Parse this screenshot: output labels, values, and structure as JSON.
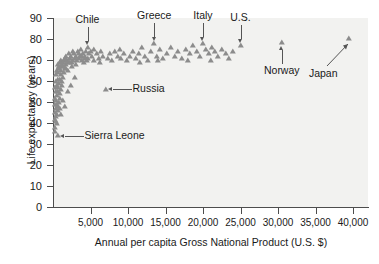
{
  "chart_data": {
    "type": "scatter",
    "title": "",
    "xlabel": "Annual per capita Gross National Product (U.S. $)",
    "ylabel": "Life expectancy (years)",
    "xlim": [
      0,
      42000
    ],
    "ylim": [
      0,
      90
    ],
    "grid": false,
    "legend": "none",
    "marker_style": "triangle",
    "marker_color": "#8c8c8c",
    "plot_background": "#f2f2f0",
    "xticks": [
      {
        "value": 5000,
        "label": "5,000"
      },
      {
        "value": 10000,
        "label": "10,000"
      },
      {
        "value": 15000,
        "label": "15,000"
      },
      {
        "value": 20000,
        "label": "20,000"
      },
      {
        "value": 25000,
        "label": "25,000"
      },
      {
        "value": 30000,
        "label": "30,000"
      },
      {
        "value": 35000,
        "label": "35,000"
      },
      {
        "value": 40000,
        "label": "40,000"
      }
    ],
    "yticks": [
      {
        "value": 0,
        "label": "0"
      },
      {
        "value": 10,
        "label": "10"
      },
      {
        "value": 20,
        "label": "20"
      },
      {
        "value": 30,
        "label": "30"
      },
      {
        "value": 40,
        "label": "40"
      },
      {
        "value": 50,
        "label": "50"
      },
      {
        "value": 60,
        "label": "60"
      },
      {
        "value": 70,
        "label": "70"
      },
      {
        "value": 80,
        "label": "80"
      },
      {
        "value": 90,
        "label": "90"
      }
    ],
    "annotations": [
      {
        "label": "Chile",
        "x": 4600,
        "y": 76,
        "leader": "down"
      },
      {
        "label": "Greece",
        "x": 13500,
        "y": 78,
        "leader": "down"
      },
      {
        "label": "Italy",
        "x": 20000,
        "y": 78,
        "leader": "down"
      },
      {
        "label": "U.S.",
        "x": 25000,
        "y": 77,
        "leader": "down"
      },
      {
        "label": "Norway",
        "x": 30500,
        "y": 78.5,
        "leader": "up"
      },
      {
        "label": "Japan",
        "x": 39500,
        "y": 80.5,
        "leader": "up-diagonal"
      },
      {
        "label": "Russia",
        "x": 7000,
        "y": 56,
        "leader": "left"
      },
      {
        "label": "Sierra Leone",
        "x": 600,
        "y": 34,
        "leader": "left"
      }
    ],
    "points": [
      [
        350,
        41
      ],
      [
        420,
        43
      ],
      [
        300,
        45
      ],
      [
        480,
        44
      ],
      [
        560,
        40
      ],
      [
        380,
        47
      ],
      [
        620,
        46
      ],
      [
        500,
        49
      ],
      [
        700,
        48
      ],
      [
        430,
        51
      ],
      [
        780,
        50
      ],
      [
        560,
        53
      ],
      [
        880,
        52
      ],
      [
        640,
        55
      ],
      [
        960,
        54
      ],
      [
        720,
        57
      ],
      [
        1050,
        56
      ],
      [
        820,
        59
      ],
      [
        1150,
        58
      ],
      [
        900,
        61
      ],
      [
        1250,
        60
      ],
      [
        1000,
        63
      ],
      [
        1350,
        62
      ],
      [
        1100,
        65
      ],
      [
        1450,
        64
      ],
      [
        1200,
        67
      ],
      [
        1550,
        66
      ],
      [
        1320,
        69
      ],
      [
        1700,
        68
      ],
      [
        1450,
        70
      ],
      [
        1850,
        70
      ],
      [
        1600,
        71
      ],
      [
        2000,
        69
      ],
      [
        1750,
        72
      ],
      [
        2200,
        71
      ],
      [
        1900,
        70
      ],
      [
        2400,
        72
      ],
      [
        2100,
        73
      ],
      [
        2600,
        70
      ],
      [
        2300,
        71
      ],
      [
        2800,
        73
      ],
      [
        2500,
        69
      ],
      [
        3000,
        72
      ],
      [
        2700,
        74
      ],
      [
        3200,
        70
      ],
      [
        2900,
        71
      ],
      [
        3400,
        73
      ],
      [
        3100,
        68
      ],
      [
        3600,
        72
      ],
      [
        3300,
        74
      ],
      [
        3800,
        70
      ],
      [
        3500,
        71
      ],
      [
        4000,
        73
      ],
      [
        3700,
        75
      ],
      [
        4200,
        71
      ],
      [
        3900,
        72
      ],
      [
        4400,
        74
      ],
      [
        4100,
        69
      ],
      [
        4600,
        76
      ],
      [
        4300,
        72
      ],
      [
        4800,
        73
      ],
      [
        4500,
        70
      ],
      [
        5000,
        74
      ],
      [
        4700,
        71
      ],
      [
        5200,
        72
      ],
      [
        5500,
        70
      ],
      [
        5800,
        73
      ],
      [
        6100,
        71
      ],
      [
        6400,
        74
      ],
      [
        6700,
        72
      ],
      [
        7000,
        56
      ],
      [
        7300,
        71
      ],
      [
        7600,
        73
      ],
      [
        7900,
        70
      ],
      [
        8200,
        74
      ],
      [
        8600,
        72
      ],
      [
        9000,
        71
      ],
      [
        9400,
        73
      ],
      [
        9800,
        70
      ],
      [
        10200,
        72
      ],
      [
        10600,
        74
      ],
      [
        11000,
        71
      ],
      [
        11400,
        73
      ],
      [
        11800,
        76
      ],
      [
        12200,
        72
      ],
      [
        12600,
        70
      ],
      [
        13000,
        74
      ],
      [
        13500,
        78
      ],
      [
        13900,
        72
      ],
      [
        14300,
        75
      ],
      [
        14700,
        71
      ],
      [
        15200,
        73
      ],
      [
        15700,
        76
      ],
      [
        16200,
        72
      ],
      [
        16700,
        74
      ],
      [
        17200,
        71
      ],
      [
        17700,
        75
      ],
      [
        18200,
        73
      ],
      [
        18700,
        77
      ],
      [
        19200,
        74
      ],
      [
        19600,
        72
      ],
      [
        20000,
        78
      ],
      [
        20400,
        75
      ],
      [
        20800,
        73
      ],
      [
        21200,
        76
      ],
      [
        21600,
        74
      ],
      [
        22000,
        72
      ],
      [
        22500,
        75
      ],
      [
        23000,
        73
      ],
      [
        23500,
        71
      ],
      [
        25000,
        77
      ],
      [
        24000,
        74
      ],
      [
        30500,
        78.5
      ],
      [
        39500,
        80.5
      ],
      [
        260,
        38
      ],
      [
        320,
        36
      ],
      [
        600,
        34
      ],
      [
        900,
        47
      ],
      [
        1050,
        44
      ],
      [
        1300,
        51
      ],
      [
        1600,
        48
      ],
      [
        2000,
        55
      ],
      [
        2400,
        58
      ],
      [
        2900,
        62
      ],
      [
        460,
        55
      ],
      [
        520,
        58
      ],
      [
        600,
        61
      ],
      [
        680,
        64
      ],
      [
        760,
        67
      ],
      [
        840,
        66
      ],
      [
        920,
        69
      ],
      [
        1080,
        70
      ],
      [
        1240,
        68
      ],
      [
        1420,
        67
      ],
      [
        1680,
        66
      ],
      [
        1950,
        65
      ],
      [
        2250,
        69
      ],
      [
        2550,
        67
      ],
      [
        200,
        42
      ],
      [
        240,
        49
      ],
      [
        280,
        52
      ],
      [
        330,
        57
      ],
      [
        390,
        60
      ],
      [
        450,
        63
      ],
      [
        530,
        65
      ],
      [
        610,
        68
      ],
      [
        5400,
        75
      ],
      [
        6200,
        69
      ],
      [
        8900,
        75
      ],
      [
        11600,
        69
      ],
      [
        14000,
        70
      ],
      [
        18000,
        70
      ],
      [
        21000,
        70
      ]
    ]
  }
}
